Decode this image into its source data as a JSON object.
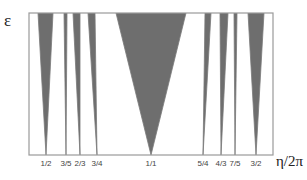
{
  "diagram": {
    "y_axis_label": "ε",
    "x_axis_label": "η/2π",
    "frame": {
      "left": 29,
      "right": 273,
      "top": 13,
      "bottom": 155
    },
    "colors": {
      "tongue": "#6e6e6e",
      "frame": "#9a9a9a",
      "line": "#7a7a7a",
      "background": "#ffffff"
    },
    "tongues": [
      {
        "label": "1/2",
        "apex_x": 46,
        "top_left": 38,
        "top_right": 53
      },
      {
        "label": "3/5",
        "apex_x": 66,
        "top_left": 64,
        "top_right": 67
      },
      {
        "label": "2/3",
        "apex_x": 80,
        "top_left": 73,
        "top_right": 80
      },
      {
        "label": "3/4",
        "apex_x": 97,
        "top_left": 88,
        "top_right": 95
      },
      {
        "label": "1/1",
        "apex_x": 151,
        "top_left": 116,
        "top_right": 186
      },
      {
        "label": "5/4",
        "apex_x": 203,
        "top_left": 205,
        "top_right": 211
      },
      {
        "label": "4/3",
        "apex_x": 221,
        "top_left": 220,
        "top_right": 228
      },
      {
        "label": "7/5",
        "apex_x": 235,
        "top_left": 234,
        "top_right": 237
      },
      {
        "label": "3/2",
        "apex_x": 256,
        "top_left": 248,
        "top_right": 264
      }
    ]
  }
}
